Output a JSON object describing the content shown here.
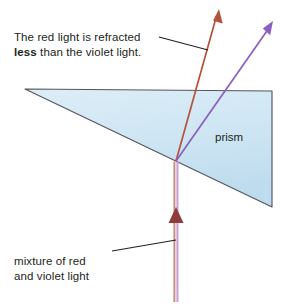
{
  "figure": {
    "background_color": "#ffffff"
  },
  "annotations": {
    "top_caption_line1": "The red light is refracted",
    "top_caption_line2_bold": "less",
    "top_caption_line2_rest": " than the violet light.",
    "bottom_caption_line1": "mixture of red",
    "bottom_caption_line2": "and violet light",
    "prism_label": "prism"
  },
  "colors": {
    "prism_fill_top": "#d7eaf4",
    "prism_fill_bottom": "#c2dff0",
    "prism_outline": "#4a4a52",
    "red_ray": "#b5523a",
    "violet_ray": "#8b5fbf",
    "incoming_ray_red": "#c08a6e",
    "incoming_ray_violet": "#c9a0d8",
    "arrowhead_dark_red": "#8e3b3b",
    "leader_line": "#231f20",
    "text": "#231f20"
  },
  "geometry": {
    "prism_vertices": [
      [
        25,
        89
      ],
      [
        272,
        91
      ],
      [
        272,
        207
      ]
    ],
    "refraction_point": [
      176,
      161
    ],
    "incoming_beam_x": 176,
    "incoming_beam_bottom_y": 302,
    "incoming_arrowhead_y": 212,
    "red_ray_tip": [
      219,
      10
    ],
    "violet_ray_tip": [
      272,
      22
    ],
    "top_leader_from": [
      159,
      37
    ],
    "top_leader_to": [
      208,
      50
    ],
    "bottom_leader_from": [
      112,
      251
    ],
    "bottom_leader_to": [
      176,
      240
    ]
  }
}
